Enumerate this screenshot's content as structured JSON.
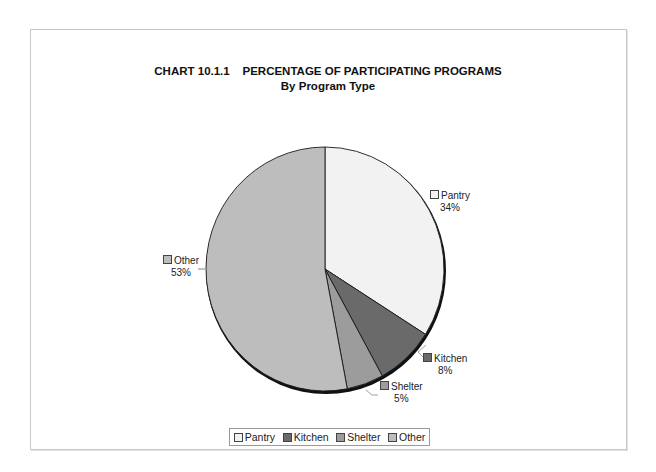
{
  "chart_data": {
    "type": "pie",
    "title": "CHART 10.1.1    PERCENTAGE OF PARTICIPATING PROGRAMS",
    "subtitle": "By Program Type",
    "categories": [
      "Pantry",
      "Kitchen",
      "Shelter",
      "Other"
    ],
    "values": [
      34,
      8,
      5,
      53
    ],
    "value_labels": [
      "34%",
      "8%",
      "5%",
      "53%"
    ],
    "colors": [
      "#f2f2f2",
      "#6a6a6a",
      "#9c9c9c",
      "#bdbdbd"
    ],
    "start_angle": "12 o'clock, clockwise",
    "legend_position": "bottom"
  },
  "title": {
    "line1": "CHART 10.1.1    PERCENTAGE OF PARTICIPATING PROGRAMS",
    "line2": "By Program Type"
  },
  "labels": {
    "pantry": {
      "name": "Pantry",
      "pct": "34%"
    },
    "kitchen": {
      "name": "Kitchen",
      "pct": "8%"
    },
    "shelter": {
      "name": "Shelter",
      "pct": "5%"
    },
    "other": {
      "name": "Other",
      "pct": "53%"
    }
  },
  "legend": [
    "Pantry",
    "Kitchen",
    "Shelter",
    "Other"
  ]
}
